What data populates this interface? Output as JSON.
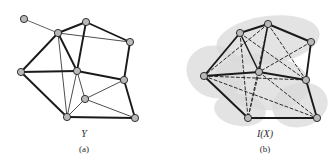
{
  "figure": {
    "background_color": "#ffffff",
    "width": 332,
    "height": 161,
    "node_fill_color": "#b9b9b9",
    "node_stroke_color": "#1e1e1e",
    "edge_color": "#1a1a1a",
    "dashed_edge_color": "#2b2b2b",
    "blob_color": "#d9d9d9"
  },
  "panels": [
    {
      "id": "panel-a",
      "symbol": "Y",
      "caption": "(a)",
      "symbol_x": 84,
      "symbol_y": 137,
      "caption_x": 84,
      "caption_y": 152,
      "has_blob": false,
      "nodes": [
        {
          "id": "a0",
          "x": 24,
          "y": 19,
          "r": 3.6
        },
        {
          "id": "a1",
          "x": 58,
          "y": 33,
          "r": 3.6
        },
        {
          "id": "a2",
          "x": 86,
          "y": 22,
          "r": 3.6
        },
        {
          "id": "a3",
          "x": 130,
          "y": 42,
          "r": 3.6
        },
        {
          "id": "a4",
          "x": 21,
          "y": 72,
          "r": 3.6
        },
        {
          "id": "a5",
          "x": 77,
          "y": 71,
          "r": 3.6
        },
        {
          "id": "a6",
          "x": 124,
          "y": 80,
          "r": 3.6
        },
        {
          "id": "a7",
          "x": 85,
          "y": 99,
          "r": 3.6
        },
        {
          "id": "a8",
          "x": 67,
          "y": 117,
          "r": 3.6
        },
        {
          "id": "a9",
          "x": 135,
          "y": 118,
          "r": 3.6
        }
      ],
      "edges": [
        {
          "from": "a0",
          "to": "a1",
          "style": "thin",
          "width": 0.8
        },
        {
          "from": "a1",
          "to": "a2",
          "style": "solid",
          "width": 1.9
        },
        {
          "from": "a1",
          "to": "a3",
          "style": "thin",
          "width": 0.9
        },
        {
          "from": "a1",
          "to": "a4",
          "style": "solid",
          "width": 1.9
        },
        {
          "from": "a1",
          "to": "a5",
          "style": "solid",
          "width": 1.9
        },
        {
          "from": "a1",
          "to": "a8",
          "style": "thin",
          "width": 0.9
        },
        {
          "from": "a2",
          "to": "a3",
          "style": "solid",
          "width": 1.9
        },
        {
          "from": "a2",
          "to": "a5",
          "style": "solid",
          "width": 1.9
        },
        {
          "from": "a3",
          "to": "a6",
          "style": "solid",
          "width": 1.9
        },
        {
          "from": "a4",
          "to": "a5",
          "style": "solid",
          "width": 1.9
        },
        {
          "from": "a4",
          "to": "a8",
          "style": "solid",
          "width": 1.9
        },
        {
          "from": "a5",
          "to": "a6",
          "style": "solid",
          "width": 1.9
        },
        {
          "from": "a5",
          "to": "a7",
          "style": "thin",
          "width": 0.9
        },
        {
          "from": "a5",
          "to": "a8",
          "style": "thin",
          "width": 0.9
        },
        {
          "from": "a6",
          "to": "a7",
          "style": "thin",
          "width": 0.9
        },
        {
          "from": "a6",
          "to": "a9",
          "style": "solid",
          "width": 1.9
        },
        {
          "from": "a7",
          "to": "a8",
          "style": "thin",
          "width": 0.9
        },
        {
          "from": "a7",
          "to": "a9",
          "style": "thin",
          "width": 0.9
        },
        {
          "from": "a8",
          "to": "a9",
          "style": "solid",
          "width": 1.9
        }
      ]
    },
    {
      "id": "panel-b",
      "symbol": "I(X)",
      "caption": "(b)",
      "symbol_x": 265,
      "symbol_y": 137,
      "caption_x": 265,
      "caption_y": 152,
      "has_blob": true,
      "nodes": [
        {
          "id": "b1",
          "x": 240,
          "y": 33,
          "r": 3.6
        },
        {
          "id": "b2",
          "x": 268,
          "y": 24,
          "r": 3.6
        },
        {
          "id": "b3",
          "x": 311,
          "y": 42,
          "r": 3.6
        },
        {
          "id": "b4",
          "x": 204,
          "y": 76,
          "r": 3.6
        },
        {
          "id": "b5",
          "x": 259,
          "y": 72,
          "r": 3.6
        },
        {
          "id": "b6",
          "x": 306,
          "y": 80,
          "r": 3.6
        },
        {
          "id": "b8",
          "x": 248,
          "y": 118,
          "r": 3.6
        },
        {
          "id": "b9",
          "x": 317,
          "y": 118,
          "r": 3.6
        }
      ],
      "edges": [
        {
          "from": "b1",
          "to": "b2",
          "style": "solid",
          "width": 1.9
        },
        {
          "from": "b1",
          "to": "b4",
          "style": "solid",
          "width": 1.9
        },
        {
          "from": "b1",
          "to": "b5",
          "style": "solid",
          "width": 1.5
        },
        {
          "from": "b2",
          "to": "b3",
          "style": "solid",
          "width": 1.9
        },
        {
          "from": "b2",
          "to": "b5",
          "style": "solid",
          "width": 1.5
        },
        {
          "from": "b3",
          "to": "b6",
          "style": "solid",
          "width": 1.9
        },
        {
          "from": "b4",
          "to": "b5",
          "style": "solid",
          "width": 1.9
        },
        {
          "from": "b4",
          "to": "b8",
          "style": "solid",
          "width": 1.9
        },
        {
          "from": "b5",
          "to": "b6",
          "style": "solid",
          "width": 1.9
        },
        {
          "from": "b6",
          "to": "b9",
          "style": "solid",
          "width": 1.9
        },
        {
          "from": "b8",
          "to": "b9",
          "style": "solid",
          "width": 1.9
        },
        {
          "from": "b1",
          "to": "b6",
          "style": "dashed",
          "width": 1.0
        },
        {
          "from": "b1",
          "to": "b8",
          "style": "dashed",
          "width": 1.0
        },
        {
          "from": "b2",
          "to": "b4",
          "style": "dashed",
          "width": 1.0
        },
        {
          "from": "b2",
          "to": "b6",
          "style": "dashed",
          "width": 1.0
        },
        {
          "from": "b2",
          "to": "b8",
          "style": "dashed",
          "width": 1.0
        },
        {
          "from": "b4",
          "to": "b6",
          "style": "dashed",
          "width": 1.0
        },
        {
          "from": "b4",
          "to": "b9",
          "style": "dashed",
          "width": 1.0
        },
        {
          "from": "b5",
          "to": "b8",
          "style": "dashed",
          "width": 1.0
        },
        {
          "from": "b5",
          "to": "b9",
          "style": "dashed",
          "width": 1.0
        },
        {
          "from": "b3",
          "to": "b5",
          "style": "dashed",
          "width": 1.0
        }
      ]
    }
  ]
}
